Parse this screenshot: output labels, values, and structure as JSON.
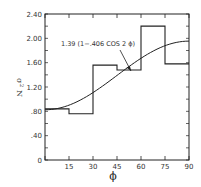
{
  "chart_data": {
    "type": "line",
    "title": "",
    "xlabel": "ϕ",
    "ylabel": "σ² N",
    "xlim": [
      0,
      90
    ],
    "ylim": [
      0,
      2.4
    ],
    "x_ticks": [
      0,
      15,
      30,
      45,
      60,
      75,
      90
    ],
    "x_tick_labels": [
      "",
      "15",
      "30",
      "45",
      "60",
      "75",
      "90"
    ],
    "y_ticks": [
      0,
      0.4,
      0.8,
      1.2,
      1.6,
      2.0,
      2.4
    ],
    "y_tick_labels": [
      "0",
      ".40",
      ".80",
      "1.20",
      "1.60",
      "2.00",
      "2.40"
    ],
    "grid": false,
    "legend": null,
    "series": [
      {
        "name": "histogram",
        "kind": "step",
        "bins": [
          [
            0,
            15
          ],
          [
            15,
            30
          ],
          [
            30,
            45
          ],
          [
            45,
            60
          ],
          [
            60,
            75
          ],
          [
            75,
            90
          ]
        ],
        "values": [
          0.84,
          0.76,
          1.56,
          1.48,
          2.2,
          1.58
        ]
      },
      {
        "name": "1.39 (1−.406 COS 2 ϕ)",
        "kind": "curve",
        "formula": "1.39*(1-0.406*cos(2*phi))",
        "x": [
          0,
          15,
          30,
          45,
          60,
          75,
          90
        ],
        "values": [
          0.826,
          0.901,
          1.108,
          1.39,
          1.672,
          1.879,
          1.954
        ]
      }
    ],
    "annotations": [
      {
        "text": "1.39 (1−.406 COS 2 ϕ)",
        "arrow_to": {
          "x": 54,
          "y": 1.45
        }
      }
    ]
  },
  "labels": {
    "annotation": "1.39 (1−.406 COS 2 ϕ)",
    "xlabel": "ϕ",
    "ylabel_sigma": "σ",
    "ylabel_sup": "2",
    "ylabel_n": "N"
  }
}
